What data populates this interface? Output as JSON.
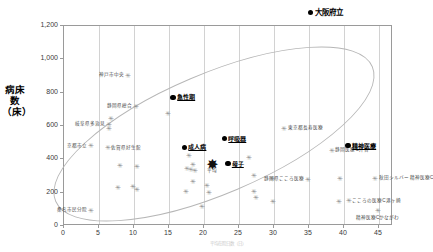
{
  "legend": {
    "marker": "filled-circle",
    "label": "大阪府立",
    "color": "#000000"
  },
  "axes": {
    "ylabel_lines": [
      "病床数",
      "（床）"
    ],
    "ylabel": "病床数（床）",
    "xlabel": "平均在院日数（日）",
    "yticks": [
      "0",
      "200",
      "400",
      "600",
      "800",
      "1,000",
      "1,200"
    ],
    "xticks": [
      "0",
      "5",
      "10",
      "15",
      "20",
      "25",
      "30",
      "35",
      "40",
      "45"
    ]
  },
  "chart_data": {
    "type": "scatter",
    "title": "",
    "xlabel": "平均在院日数（日）",
    "ylabel": "病床数（床）",
    "xlim": [
      0,
      47
    ],
    "ylim": [
      0,
      1200
    ],
    "xticks": [
      0,
      5,
      10,
      15,
      20,
      25,
      30,
      35,
      40,
      45
    ],
    "yticks": [
      0,
      200,
      400,
      600,
      800,
      1000,
      1200
    ],
    "grid": "vertical",
    "legend_position": "top-right",
    "annotation_shape": "ellipse",
    "series": [
      {
        "name": "一般病院",
        "marker": "gray-asterisk",
        "points": [
          {
            "x": 9.0,
            "y": 905,
            "label": "神戸市中央"
          },
          {
            "x": 10.2,
            "y": 720,
            "label": "静岡県総合"
          },
          {
            "x": 6.3,
            "y": 612,
            "label": "岐阜県多治見"
          },
          {
            "x": 6.6,
            "y": 645,
            "label": ""
          },
          {
            "x": 6.4,
            "y": 588,
            "label": ""
          },
          {
            "x": 14.8,
            "y": 678,
            "label": ""
          },
          {
            "x": 3.8,
            "y": 482,
            "label": "京都市立"
          },
          {
            "x": 6.2,
            "y": 470,
            "label": "佐賀県好生館"
          },
          {
            "x": 31.4,
            "y": 588,
            "label": "東京都長寿医療"
          },
          {
            "x": 38.2,
            "y": 455,
            "label": "静岡医療C芹香"
          },
          {
            "x": 7.9,
            "y": 362,
            "label": ""
          },
          {
            "x": 10.4,
            "y": 355,
            "label": ""
          },
          {
            "x": 17.8,
            "y": 425,
            "label": ""
          },
          {
            "x": 18.3,
            "y": 372,
            "label": ""
          },
          {
            "x": 17.5,
            "y": 348,
            "label": ""
          },
          {
            "x": 18.1,
            "y": 340,
            "label": ""
          },
          {
            "x": 18.6,
            "y": 335,
            "label": ""
          },
          {
            "x": 26.4,
            "y": 412,
            "label": ""
          },
          {
            "x": 18.4,
            "y": 270,
            "label": ""
          },
          {
            "x": 27.1,
            "y": 305,
            "label": ""
          },
          {
            "x": 29.7,
            "y": 288,
            "label": ""
          },
          {
            "x": 17.4,
            "y": 205,
            "label": ""
          },
          {
            "x": 20.4,
            "y": 245,
            "label": ""
          },
          {
            "x": 20.6,
            "y": 202,
            "label": ""
          },
          {
            "x": 27.0,
            "y": 205,
            "label": ""
          },
          {
            "x": 27.3,
            "y": 172,
            "label": ""
          },
          {
            "x": 29.8,
            "y": 148,
            "label": ""
          },
          {
            "x": 19.7,
            "y": 118,
            "label": ""
          },
          {
            "x": 7.6,
            "y": 232,
            "label": ""
          },
          {
            "x": 9.8,
            "y": 238,
            "label": ""
          },
          {
            "x": 10.3,
            "y": 222,
            "label": ""
          },
          {
            "x": 34.8,
            "y": 282,
            "label": "静岡県こころ医療"
          },
          {
            "x": 39.4,
            "y": 285,
            "label": ""
          },
          {
            "x": 44.4,
            "y": 288,
            "label": "秋田シルバー 精神医療C"
          },
          {
            "x": 39.2,
            "y": 148,
            "label": ""
          },
          {
            "x": 40.6,
            "y": 152,
            "label": "こころの医療C港ヶ崎"
          },
          {
            "x": 44.8,
            "y": 92,
            "label": "精神医療Cかながわ"
          },
          {
            "x": 3.8,
            "y": 95,
            "label": "桑名市民分院"
          }
        ]
      },
      {
        "name": "大阪府立",
        "marker": "black-circle",
        "points": [
          {
            "x": 15.6,
            "y": 772,
            "label": "急性期"
          },
          {
            "x": 22.9,
            "y": 525,
            "label": "呼吸器"
          },
          {
            "x": 17.2,
            "y": 472,
            "label": "成人病"
          },
          {
            "x": 23.4,
            "y": 375,
            "label": "母子"
          },
          {
            "x": 40.6,
            "y": 482,
            "label": "精神医療"
          }
        ]
      },
      {
        "name": "平均",
        "marker": "large-star",
        "points": [
          {
            "x": 21.2,
            "y": 372,
            "label": "平均"
          }
        ]
      }
    ]
  }
}
